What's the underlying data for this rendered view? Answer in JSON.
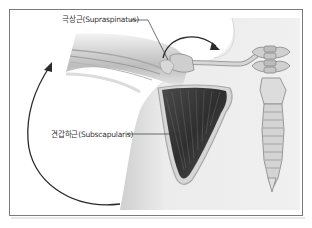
{
  "figure": {
    "labels": {
      "supraspinatus": "극상근(Supraspinatus)",
      "subscapularis": "견갑하근(Subscapularis)"
    },
    "structures": [
      "arm-bone-humerus",
      "clavicle",
      "scapula-with-subscapularis",
      "spine-vertebrae",
      "sternum"
    ],
    "arrows": [
      {
        "name": "internal-rotation-arrow",
        "direction": "counter-clockwise large arc on left"
      },
      {
        "name": "shoulder-rotation-arrow",
        "direction": "arc over shoulder pointing right"
      }
    ],
    "colors": {
      "frame": "#7a7a7a",
      "body_skin": "#e4e4e4",
      "muscle_dark": "#3a3a3a",
      "bone": "#c8c8c8",
      "label_text": "#333333",
      "arrow": "#2a2a2a"
    }
  }
}
